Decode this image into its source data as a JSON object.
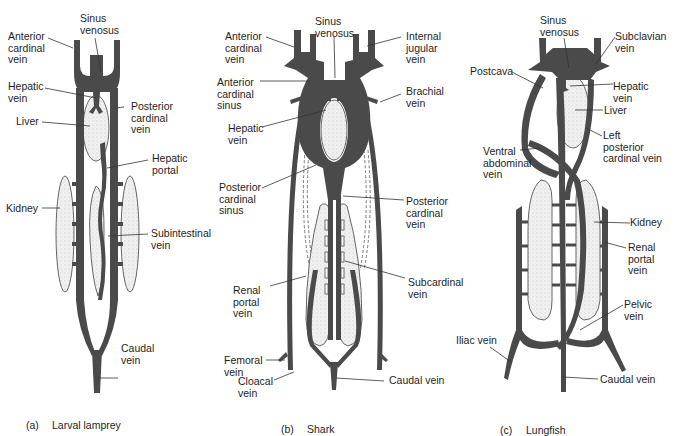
{
  "figure": {
    "colors": {
      "vein": "#4a4a4a",
      "organ_fill": "#ececec",
      "organ_stroke": "#555555",
      "leader": "#333333",
      "background": "#ffffff"
    },
    "panels": [
      {
        "id": "a",
        "caption_tag": "(a)",
        "caption": "Larval lamprey",
        "labels": {
          "sinus_venosus": "Sinus\nvenosus",
          "anterior_cardinal_vein": "Anterior\ncardinal\nvein",
          "hepatic_vein": "Hepatic\nvein",
          "posterior_cardinal_vein": "Posterior\ncardinal\nvein",
          "liver": "Liver",
          "hepatic_portal": "Hepatic\nportal",
          "kidney": "Kidney",
          "subintestinal_vein": "Subintestinal\nvein",
          "caudal_vein": "Caudal\nvein"
        }
      },
      {
        "id": "b",
        "caption_tag": "(b)",
        "caption": "Shark",
        "labels": {
          "sinus_venosus": "Sinus\nvenosus",
          "anterior_cardinal_vein": "Anterior\ncardinal\nvein",
          "internal_jugular_vein": "Internal\njugular\nvein",
          "anterior_cardinal_sinus": "Anterior\ncardinal\nsinus",
          "brachial_vein": "Brachial\nvein",
          "hepatic_vein": "Hepatic\nvein",
          "posterior_cardinal_sinus": "Posterior\ncardinal\nsinus",
          "posterior_cardinal_vein": "Posterior\ncardinal\nvein",
          "renal_portal_vein": "Renal\nportal\nvein",
          "subcardinal_vein": "Subcardinal\nvein",
          "femoral_vein": "Femoral\nvein",
          "cloacal_vein": "Cloacal\nvein",
          "caudal_vein": "Caudal vein"
        }
      },
      {
        "id": "c",
        "caption_tag": "(c)",
        "caption": "Lungfish",
        "labels": {
          "sinus_venosus": "Sinus\nvenosus",
          "subclavian_vein": "Subclavian\nvein",
          "postcava": "Postcava",
          "hepatic_vein": "Hepatic\nvein",
          "liver": "Liver",
          "left_posterior_cardinal_vein": "Left\nposterior\ncardinal vein",
          "ventral_abdominal_vein": "Ventral\nabdominal\nvein",
          "kidney": "Kidney",
          "renal_portal_vein": "Renal\nportal\nvein",
          "pelvic_vein": "Pelvic\nvein",
          "iliac_vein": "Iliac vein",
          "caudal_vein": "Caudal vein"
        }
      }
    ]
  }
}
